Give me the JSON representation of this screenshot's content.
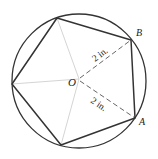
{
  "diagram": {
    "type": "regular pentagon inscribed in circle",
    "center": {
      "label": "O",
      "x": 79,
      "y": 79
    },
    "circle": {
      "cx": 79,
      "cy": 80,
      "r": 67,
      "stroke": "#333333"
    },
    "vertices": [
      {
        "id": "top",
        "x": 57,
        "y": 18
      },
      {
        "id": "B",
        "label": "B",
        "x": 131,
        "y": 40
      },
      {
        "id": "A",
        "label": "A",
        "x": 135,
        "y": 118
      },
      {
        "id": "bottom",
        "x": 61,
        "y": 145
      },
      {
        "id": "left",
        "x": 12,
        "y": 84
      }
    ],
    "labels": {
      "center": "O",
      "vertex_b": "B",
      "vertex_a": "A",
      "radius_ob": "2 in.",
      "radius_oa": "2 in."
    },
    "colors": {
      "outline": "#333333",
      "spokes": "#cccccc",
      "dashed": "#555555"
    }
  }
}
